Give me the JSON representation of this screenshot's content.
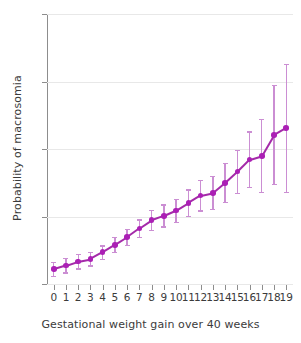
{
  "chart_data": {
    "type": "scatter",
    "title": "",
    "xlabel": "Gestational weight gain over 40 weeks",
    "ylabel": "Probability of macrosomia",
    "xlim": [
      -0.55,
      19.55
    ],
    "ylim": [
      0,
      0.08
    ],
    "grid": true,
    "legend": null,
    "x_tick_labels": [
      "0",
      "1",
      "2",
      "3",
      "4",
      "5",
      "6",
      "7",
      "8",
      "9",
      "10",
      "11",
      "12",
      "13",
      "14",
      "15",
      "16",
      "17",
      "18",
      "19"
    ],
    "y_tick_labels": [
      "0",
      ".02",
      ".04",
      ".06",
      ".08"
    ],
    "y_ticks": [
      0,
      0.02,
      0.04,
      0.06,
      0.08
    ],
    "marker_color": "#ab1fb5",
    "errorbar_color": "#cb8ed3",
    "series": [
      {
        "name": "Probability of macrosomia",
        "x": [
          0,
          1,
          2,
          3,
          4,
          5,
          6,
          7,
          8,
          9,
          10,
          11,
          12,
          13,
          14,
          15,
          16,
          17,
          18,
          19
        ],
        "values": [
          0.0044,
          0.0055,
          0.0067,
          0.0074,
          0.0094,
          0.0116,
          0.0139,
          0.0165,
          0.0189,
          0.0202,
          0.0218,
          0.024,
          0.0262,
          0.027,
          0.03,
          0.0333,
          0.0369,
          0.038,
          0.0442,
          0.0463
        ],
        "ci_lower": [
          0.0025,
          0.0035,
          0.0046,
          0.0055,
          0.0074,
          0.0096,
          0.0117,
          0.014,
          0.016,
          0.0171,
          0.0185,
          0.0202,
          0.0218,
          0.0222,
          0.0243,
          0.027,
          0.0288,
          0.0273,
          0.0296,
          0.0274
        ],
        "ci_upper": [
          0.0065,
          0.0078,
          0.009,
          0.0096,
          0.0115,
          0.0139,
          0.0163,
          0.0192,
          0.0219,
          0.0236,
          0.0253,
          0.0281,
          0.0308,
          0.0321,
          0.036,
          0.0398,
          0.0452,
          0.0489,
          0.059,
          0.0652
        ]
      }
    ]
  },
  "axes": {
    "x_title": "Gestational weight gain over 40 weeks",
    "y_title": "Probability of macrosomia"
  }
}
